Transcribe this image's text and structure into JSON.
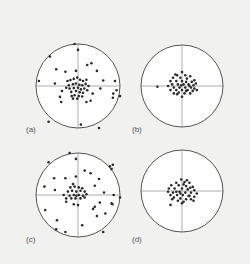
{
  "figure": {
    "background": "#f1f1f0",
    "circle_fill": "#ffffff",
    "circle_stroke": "#555555",
    "axis_stroke": "#777777",
    "point_color": "#2a2a2a",
    "panels": [
      {
        "label": "(a)",
        "cx": 78,
        "cy": 86,
        "r": 42,
        "label_x": 26,
        "label_y": 126,
        "description": "wide scatter with central cluster",
        "points": [
          [
            -0.08,
            -1.0
          ],
          [
            0.0,
            -0.86
          ],
          [
            -0.67,
            -0.7
          ],
          [
            -0.52,
            -0.4
          ],
          [
            -0.3,
            -0.34
          ],
          [
            -0.05,
            -0.36
          ],
          [
            0.22,
            -0.5
          ],
          [
            0.32,
            -0.54
          ],
          [
            0.45,
            -0.36
          ],
          [
            -0.93,
            -0.12
          ],
          [
            -0.55,
            -0.06
          ],
          [
            0.6,
            -0.13
          ],
          [
            0.88,
            -0.12
          ],
          [
            0.92,
            0.1
          ],
          [
            0.84,
            0.18
          ],
          [
            0.83,
            0.28
          ],
          [
            1.0,
            0.24
          ],
          [
            0.53,
            0.06
          ],
          [
            -0.38,
            0.12
          ],
          [
            -0.43,
            0.26
          ],
          [
            -0.4,
            0.38
          ],
          [
            0.35,
            0.18
          ],
          [
            0.3,
            0.35
          ],
          [
            0.2,
            0.38
          ],
          [
            -0.7,
            0.85
          ],
          [
            0.07,
            0.92
          ],
          [
            0.5,
            1.0
          ],
          [
            -0.25,
            -0.12
          ],
          [
            -0.18,
            -0.14
          ],
          [
            -0.1,
            -0.17
          ],
          [
            -0.02,
            -0.2
          ],
          [
            0.05,
            -0.15
          ],
          [
            0.12,
            -0.12
          ],
          [
            -0.22,
            -0.02
          ],
          [
            -0.12,
            -0.04
          ],
          [
            -0.05,
            -0.06
          ],
          [
            0.03,
            -0.03
          ],
          [
            0.1,
            -0.02
          ],
          [
            0.18,
            -0.05
          ],
          [
            -0.2,
            0.06
          ],
          [
            -0.1,
            0.05
          ],
          [
            0.0,
            0.04
          ],
          [
            0.07,
            0.08
          ],
          [
            0.15,
            0.06
          ],
          [
            -0.16,
            0.14
          ],
          [
            -0.05,
            0.12
          ],
          [
            0.04,
            0.15
          ],
          [
            0.12,
            0.16
          ],
          [
            -0.08,
            0.22
          ],
          [
            0.02,
            0.24
          ],
          [
            0.1,
            0.25
          ],
          [
            -0.15,
            0.24
          ],
          [
            0.22,
            0.1
          ],
          [
            0.2,
            -0.15
          ],
          [
            -0.28,
            0.04
          ],
          [
            0.25,
            0.0
          ],
          [
            -0.02,
            0.3
          ],
          [
            -0.12,
            0.3
          ]
        ]
      },
      {
        "label": "(b)",
        "cx": 182,
        "cy": 86,
        "r": 41,
        "label_x": 132,
        "label_y": 126,
        "description": "tight cluster slightly above center",
        "points": [
          [
            -0.6,
            0.02
          ],
          [
            0.0,
            -0.34
          ],
          [
            -0.12,
            -0.26
          ],
          [
            0.08,
            -0.26
          ],
          [
            0.2,
            -0.24
          ],
          [
            -0.22,
            -0.2
          ],
          [
            -0.04,
            -0.2
          ],
          [
            0.12,
            -0.18
          ],
          [
            0.3,
            -0.14
          ],
          [
            -0.28,
            -0.12
          ],
          [
            -0.14,
            -0.12
          ],
          [
            0.0,
            -0.12
          ],
          [
            0.1,
            -0.1
          ],
          [
            0.24,
            -0.1
          ],
          [
            -0.24,
            -0.04
          ],
          [
            -0.1,
            -0.04
          ],
          [
            0.04,
            -0.04
          ],
          [
            0.16,
            -0.04
          ],
          [
            0.28,
            -0.02
          ],
          [
            -0.2,
            0.04
          ],
          [
            -0.06,
            0.04
          ],
          [
            0.08,
            0.04
          ],
          [
            0.22,
            0.04
          ],
          [
            0.36,
            0.1
          ],
          [
            -0.28,
            0.1
          ],
          [
            -0.14,
            0.1
          ],
          [
            0.0,
            0.1
          ],
          [
            0.14,
            0.1
          ],
          [
            0.26,
            0.12
          ],
          [
            -0.08,
            0.16
          ],
          [
            0.06,
            0.18
          ],
          [
            0.2,
            0.18
          ],
          [
            -0.2,
            0.18
          ],
          [
            0.0,
            0.26
          ],
          [
            -0.34,
            0.0
          ],
          [
            0.34,
            -0.06
          ],
          [
            -0.16,
            -0.28
          ],
          [
            0.18,
            0.0
          ],
          [
            -0.02,
            -0.02
          ],
          [
            0.1,
            0.12
          ],
          [
            -0.12,
            0.2
          ],
          [
            0.3,
            0.06
          ]
        ]
      },
      {
        "label": "(c)",
        "cx": 78,
        "cy": 195,
        "r": 42,
        "label_x": 26,
        "label_y": 236,
        "description": "wide scatter with central cluster, skewed",
        "points": [
          [
            -0.2,
            -1.0
          ],
          [
            -0.05,
            -0.86
          ],
          [
            -0.7,
            -0.78
          ],
          [
            0.76,
            -0.68
          ],
          [
            0.83,
            -0.72
          ],
          [
            0.8,
            -0.62
          ],
          [
            -0.57,
            -0.4
          ],
          [
            -0.3,
            -0.4
          ],
          [
            -0.05,
            -0.44
          ],
          [
            0.3,
            -0.52
          ],
          [
            0.16,
            -0.58
          ],
          [
            0.5,
            -0.38
          ],
          [
            -0.8,
            -0.2
          ],
          [
            -0.55,
            -0.12
          ],
          [
            0.4,
            -0.22
          ],
          [
            0.62,
            -0.06
          ],
          [
            0.85,
            0.0
          ],
          [
            0.82,
            0.22
          ],
          [
            1.0,
            0.06
          ],
          [
            0.52,
            0.18
          ],
          [
            -0.78,
            0.36
          ],
          [
            -0.5,
            0.6
          ],
          [
            -0.28,
            0.16
          ],
          [
            -0.1,
            0.22
          ],
          [
            0.0,
            0.24
          ],
          [
            0.4,
            0.28
          ],
          [
            0.36,
            0.33
          ],
          [
            0.45,
            0.5
          ],
          [
            0.65,
            0.44
          ],
          [
            0.8,
            0.2
          ],
          [
            -0.3,
            0.88
          ],
          [
            -0.52,
            0.82
          ],
          [
            0.1,
            0.72
          ],
          [
            0.6,
            0.88
          ],
          [
            -0.04,
            0.02
          ],
          [
            -0.18,
            -0.18
          ],
          [
            -0.08,
            -0.2
          ],
          [
            0.02,
            -0.18
          ],
          [
            0.1,
            -0.16
          ],
          [
            -0.24,
            -0.08
          ],
          [
            -0.14,
            -0.1
          ],
          [
            -0.04,
            -0.08
          ],
          [
            0.06,
            -0.1
          ],
          [
            0.16,
            -0.08
          ],
          [
            -0.2,
            0.02
          ],
          [
            -0.1,
            0.0
          ],
          [
            0.02,
            0.0
          ],
          [
            0.12,
            0.02
          ],
          [
            -0.16,
            0.08
          ],
          [
            -0.06,
            0.08
          ],
          [
            0.06,
            0.08
          ],
          [
            0.16,
            0.06
          ],
          [
            -0.34,
            0.0
          ],
          [
            -0.28,
            0.08
          ],
          [
            -0.12,
            -0.26
          ],
          [
            0.2,
            -0.02
          ]
        ]
      },
      {
        "label": "(d)",
        "cx": 182,
        "cy": 191,
        "r": 41,
        "label_x": 132,
        "label_y": 236,
        "description": "tight cluster near center",
        "points": [
          [
            -0.02,
            -0.28
          ],
          [
            -0.14,
            -0.2
          ],
          [
            0.06,
            -0.22
          ],
          [
            0.18,
            -0.2
          ],
          [
            -0.26,
            -0.14
          ],
          [
            -0.08,
            -0.14
          ],
          [
            0.1,
            -0.12
          ],
          [
            0.26,
            -0.1
          ],
          [
            -0.32,
            -0.06
          ],
          [
            -0.18,
            -0.06
          ],
          [
            0.0,
            -0.06
          ],
          [
            0.14,
            -0.04
          ],
          [
            0.3,
            -0.02
          ],
          [
            -0.34,
            0.02
          ],
          [
            -0.22,
            0.04
          ],
          [
            -0.06,
            0.02
          ],
          [
            0.08,
            0.04
          ],
          [
            0.22,
            0.04
          ],
          [
            -0.28,
            0.1
          ],
          [
            -0.12,
            0.1
          ],
          [
            0.02,
            0.1
          ],
          [
            0.16,
            0.12
          ],
          [
            0.3,
            0.14
          ],
          [
            -0.2,
            0.16
          ],
          [
            -0.04,
            0.18
          ],
          [
            0.1,
            0.2
          ],
          [
            0.22,
            0.2
          ],
          [
            -0.1,
            0.24
          ],
          [
            0.04,
            0.26
          ],
          [
            -0.28,
            0.34
          ],
          [
            0.18,
            0.12
          ],
          [
            -0.14,
            0.02
          ],
          [
            0.04,
            -0.16
          ],
          [
            0.2,
            -0.08
          ],
          [
            -0.24,
            0.2
          ],
          [
            0.36,
            0.06
          ],
          [
            0.12,
            -0.26
          ],
          [
            -0.04,
            0.06
          ],
          [
            0.0,
            0.3
          ],
          [
            0.28,
            0.24
          ]
        ]
      }
    ]
  }
}
